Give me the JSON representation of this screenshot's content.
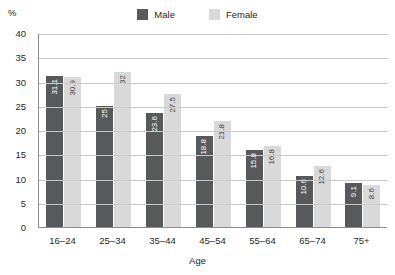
{
  "colors": {
    "male": "#58595b",
    "female": "#d9d9d9",
    "gridline": "#c9c9c9",
    "axis": "#8c8c8c",
    "text": "#231f20"
  },
  "legend": {
    "position": "top-center",
    "entries": [
      {
        "label": "Male",
        "color": "#58595b",
        "swatch_name": "legend-swatch-male"
      },
      {
        "label": "Female",
        "color": "#d9d9d9",
        "swatch_name": "legend-swatch-female"
      }
    ]
  },
  "chart_data": {
    "type": "bar",
    "title": "",
    "subtitle": "",
    "xlabel": "Age",
    "ylabel": "%",
    "ylim": [
      0,
      40
    ],
    "yticks": [
      0,
      5,
      10,
      15,
      20,
      25,
      30,
      35,
      40
    ],
    "ytick_labels": [
      "0",
      "5",
      "10",
      "15",
      "20",
      "25",
      "30",
      "35",
      "40"
    ],
    "grid": true,
    "grid_axis": "y",
    "legend_position": "top-center",
    "categories": [
      "16–24",
      "25–34",
      "35–44",
      "45–54",
      "55–64",
      "65–74",
      "75+"
    ],
    "series": [
      {
        "name": "Male",
        "color": "#58595b",
        "values": [
          31.1,
          25,
          23.6,
          18.8,
          15.8,
          10.6,
          9.1
        ],
        "value_labels": [
          "31.1",
          "25",
          "23.6",
          "18.8",
          "15.8",
          "10.6",
          "9.1"
        ]
      },
      {
        "name": "Female",
        "color": "#d9d9d9",
        "values": [
          30.9,
          32,
          27.5,
          21.8,
          16.8,
          12.6,
          8.6
        ],
        "value_labels": [
          "30.9",
          "32",
          "27.5",
          "21.8",
          "16.8",
          "12.6",
          "8.6"
        ]
      }
    ]
  }
}
